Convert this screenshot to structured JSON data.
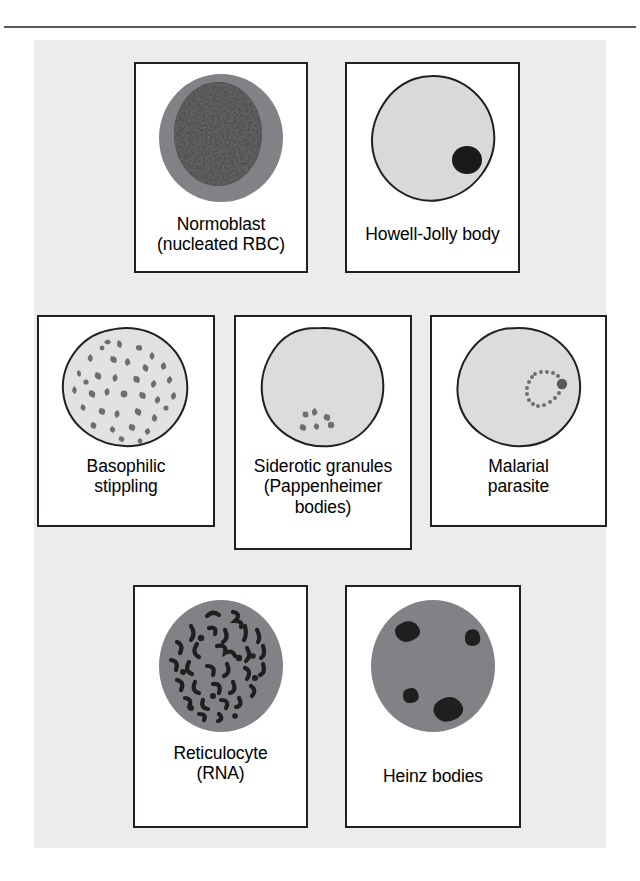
{
  "figure": {
    "kind": "red-blood-cell-inclusions-diagram",
    "background_color": "#ececed",
    "card_background_color": "#ffffff",
    "card_border_color": "#231f20",
    "rule_color": "#58595b",
    "label_color": "#000000"
  },
  "colors": {
    "rbc_pale_fill": "#d9d9d9",
    "rbc_medium_fill": "#808285",
    "rbc_outline": "#231f20",
    "nucleus_dark": "#2b2b2b",
    "inclusion_dark": "#1a1a1a",
    "granule_gray": "#6d6e71"
  },
  "rows": [
    {
      "name": "row-top",
      "cards": [
        {
          "id": "normoblast",
          "icon": "normoblast-cell-icon",
          "label": "Normoblast\n(nucleated RBC)",
          "lines": [
            "Normoblast",
            "(nucleated RBC)"
          ]
        },
        {
          "id": "howell-jolly",
          "icon": "howell-jolly-body-cell-icon",
          "label": "Howell-Jolly body",
          "lines": [
            "Howell-Jolly body"
          ]
        }
      ]
    },
    {
      "name": "row-middle",
      "cards": [
        {
          "id": "basophilic",
          "icon": "basophilic-stippling-cell-icon",
          "label": "Basophilic\nstippling",
          "lines": [
            "Basophilic",
            "stippling"
          ]
        },
        {
          "id": "siderotic",
          "icon": "siderotic-granules-cell-icon",
          "label": "Siderotic granules\n(Pappenheimer\nbodies)",
          "lines": [
            "Siderotic granules",
            "(Pappenheimer",
            "bodies)"
          ]
        },
        {
          "id": "malarial",
          "icon": "malarial-parasite-cell-icon",
          "label": "Malarial\nparasite",
          "lines": [
            "Malarial",
            "parasite"
          ]
        }
      ]
    },
    {
      "name": "row-bottom",
      "cards": [
        {
          "id": "reticulocyte",
          "icon": "reticulocyte-cell-icon",
          "label": "Reticulocyte\n(RNA)",
          "lines": [
            "Reticulocyte",
            "(RNA)"
          ]
        },
        {
          "id": "heinz",
          "icon": "heinz-bodies-cell-icon",
          "label": "Heinz bodies",
          "lines": [
            "Heinz bodies"
          ]
        }
      ]
    }
  ]
}
